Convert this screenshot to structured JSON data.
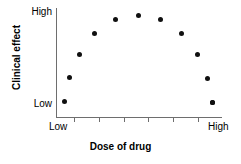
{
  "chart_data": {
    "type": "scatter",
    "title": "",
    "subtitle": "",
    "xlabel": "Dose of drug",
    "ylabel": "Clinical effect",
    "grid": false,
    "legend": "none",
    "xlim": [
      0,
      1
    ],
    "ylim": [
      0,
      1
    ],
    "x_tick_labels": [
      "Low",
      "High"
    ],
    "y_tick_labels": [
      "High",
      "Low"
    ],
    "x_tick_label_low": "Low",
    "x_tick_label_high": "High",
    "y_tick_label_low": "Low",
    "y_tick_label_high": "High",
    "annotation": "",
    "point_color": "#101010",
    "axis_color": "#6e6e6e",
    "n_points": 12,
    "x": [
      0.05,
      0.08,
      0.14,
      0.23,
      0.35,
      0.41,
      0.49,
      0.63,
      0.75,
      0.85,
      0.91,
      0.94
    ],
    "y": [
      0.15,
      0.38,
      0.59,
      0.79,
      0.93,
      0.98,
      0.92,
      0.78,
      0.59,
      0.37,
      0.14,
      0.13
    ],
    "points": [
      {
        "x": 0.05,
        "y": 0.15,
        "px": 64,
        "py": 101
      },
      {
        "x": 0.08,
        "y": 0.38,
        "px": 69,
        "py": 77
      },
      {
        "x": 0.14,
        "y": 0.59,
        "px": 79,
        "py": 54
      },
      {
        "x": 0.23,
        "y": 0.79,
        "px": 94,
        "py": 33
      },
      {
        "x": 0.35,
        "y": 0.93,
        "px": 115,
        "py": 19
      },
      {
        "x": 0.41,
        "y": 0.98,
        "px": 138,
        "py": 15
      },
      {
        "x": 0.49,
        "y": 0.92,
        "px": 160,
        "py": 19
      },
      {
        "x": 0.63,
        "y": 0.78,
        "px": 181,
        "py": 33
      },
      {
        "x": 0.75,
        "y": 0.59,
        "px": 197,
        "py": 54
      },
      {
        "x": 0.85,
        "y": 0.37,
        "px": 207,
        "py": 78
      },
      {
        "x": 0.91,
        "y": 0.14,
        "px": 212,
        "py": 102
      },
      {
        "x": 0.94,
        "y": 0.13,
        "px": 212,
        "py": 102
      }
    ],
    "x_tick_positions_px": [
      74,
      99,
      124,
      148,
      173,
      198
    ]
  }
}
